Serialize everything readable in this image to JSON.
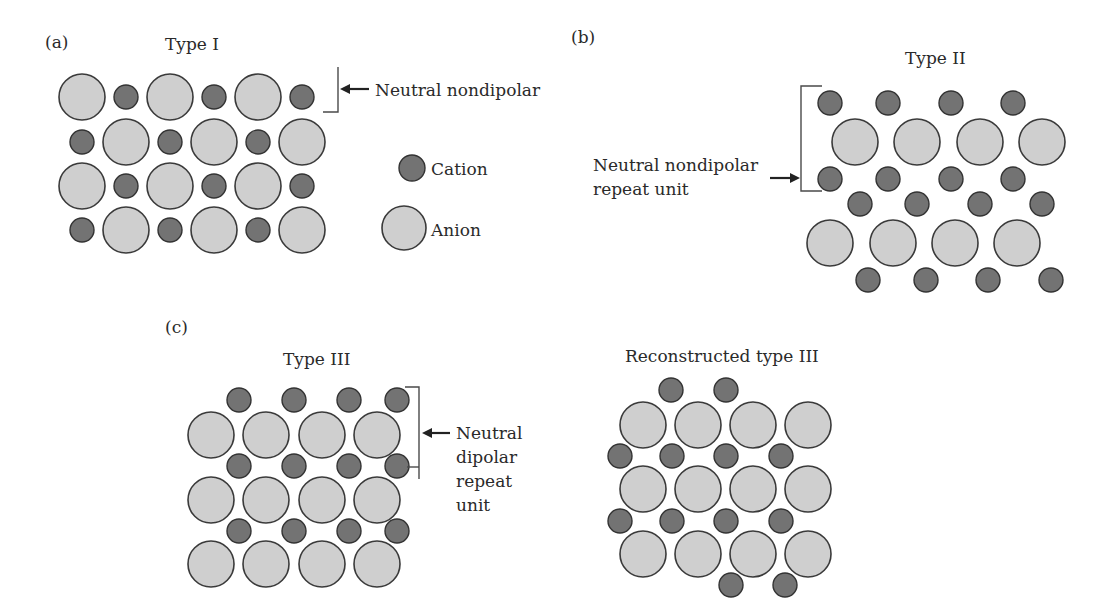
{
  "figure": {
    "panels": {
      "a": {
        "label": "(a)",
        "title": "Type I",
        "annotation": [
          "Neutral nondipolar"
        ]
      },
      "b": {
        "label": "(b)",
        "title": "Type II",
        "annotation": [
          "Neutral nondipolar",
          "repeat unit"
        ]
      },
      "c": {
        "label": "(c)",
        "title": "Type III",
        "annotation": [
          "Neutral",
          "dipolar",
          "repeat",
          "unit"
        ]
      },
      "c2": {
        "title": "Reconstructed type III"
      }
    },
    "legend": {
      "cation": "Cation",
      "anion": "Anion"
    },
    "colors": {
      "anion_fill": "#cfcfcf",
      "cation_fill": "#737373",
      "outline": "#3a3a3a"
    },
    "lattices": {
      "type_I": [
        [
          "anion",
          "cation",
          "anion",
          "cation",
          "anion",
          "cation"
        ],
        [
          "cation",
          "anion",
          "cation",
          "anion",
          "cation",
          "anion"
        ],
        [
          "anion",
          "cation",
          "anion",
          "cation",
          "anion",
          "cation"
        ],
        [
          "cation",
          "anion",
          "cation",
          "anion",
          "cation",
          "anion"
        ]
      ],
      "type_II_layers": [
        "cation",
        "anion",
        "cation",
        "cation",
        "anion",
        "cation"
      ],
      "type_III_layers": [
        "cation",
        "anion",
        "cation",
        "anion",
        "cation",
        "anion"
      ],
      "reconstructed_type_III_layers": [
        "cation-half",
        "anion",
        "cation",
        "anion",
        "cation",
        "anion",
        "cation-half"
      ]
    }
  }
}
